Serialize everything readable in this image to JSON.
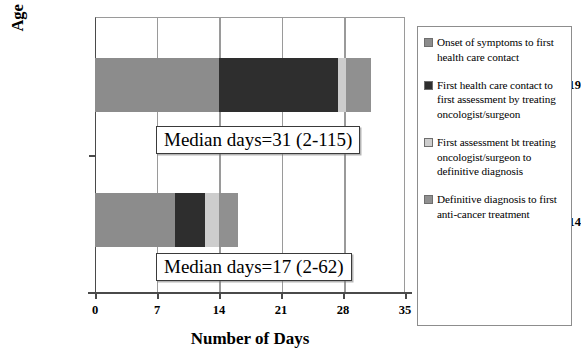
{
  "chart_data": {
    "type": "bar",
    "orientation": "horizontal",
    "stacked": true,
    "title": "",
    "xlabel": "Number of Days",
    "ylabel": "Age in years",
    "categories": [
      "15-19",
      "0-14"
    ],
    "xticks": [
      0,
      7,
      14,
      21,
      28,
      35
    ],
    "xlim": [
      0,
      35
    ],
    "grid": true,
    "legend_position": "right",
    "series": [
      {
        "name": "Onset of symptoms to first health care contact",
        "color": "#8c8c8c",
        "values": [
          14.0,
          9.0
        ]
      },
      {
        "name": "First health care contact to first assessment by treating oncologist/surgeon",
        "color": "#2e2e2e",
        "values": [
          13.4,
          3.4
        ]
      },
      {
        "name": "First assessment bt treating oncologist/surgeon to definitive diagnosis",
        "color": "#cdcdcd",
        "values": [
          0.9,
          1.6
        ]
      },
      {
        "name": "Definitive diagnosis to first anti-cancer treatment",
        "color": "#909090",
        "values": [
          2.9,
          2.2
        ]
      }
    ],
    "totals": [
      31.2,
      16.2
    ],
    "annotations": [
      {
        "category": "15-19",
        "text": "Median days=31 (2-115)"
      },
      {
        "category": "0-14",
        "text": "Median days=17 (2-62)"
      }
    ]
  },
  "axis": {
    "y_title": "Age in years",
    "x_title": "Number of Days",
    "x_tick_labels": [
      "0",
      "7",
      "14",
      "21",
      "28",
      "35"
    ],
    "y_tick_labels": [
      "15-19",
      "0-14"
    ]
  },
  "legend": {
    "items": [
      {
        "label": "Onset of symptoms to first health care contact",
        "color": "#8c8c8c"
      },
      {
        "label": "First health care contact to first assessment by treating oncologist/surgeon",
        "color": "#2e2e2e"
      },
      {
        "label": "First assessment bt treating oncologist/surgeon to definitive diagnosis",
        "color": "#cdcdcd"
      },
      {
        "label": "Definitive diagnosis to first anti-cancer treatment",
        "color": "#909090"
      }
    ]
  },
  "annotations": {
    "median_upper": "Median days=31 (2-115)",
    "median_lower": "Median days=17 (2-62)"
  },
  "colors": {
    "segment_1": "#8c8c8c",
    "segment_2": "#2e2e2e",
    "segment_3": "#cdcdcd",
    "segment_4": "#909090",
    "axis": "#4a4a4a",
    "grid": "#9a9a9a"
  }
}
